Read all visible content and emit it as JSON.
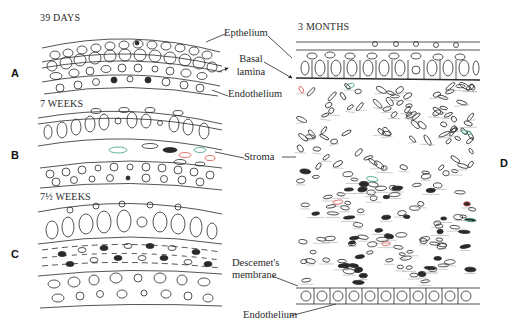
{
  "figure": {
    "topic": "Corneal development stages",
    "panels": [
      {
        "id": "A",
        "stage": "39 DAYS"
      },
      {
        "id": "B",
        "stage": "7 WEEKS"
      },
      {
        "id": "C",
        "stage": "7½ WEEKS"
      },
      {
        "id": "D",
        "stage": "3 MONTHS"
      }
    ],
    "labels": {
      "epithelium": "Epthelium",
      "basal_lamina_1": "Basal",
      "basal_lamina_2": "lamina",
      "endothelium_top": "Endothelium",
      "stroma": "Stroma",
      "descemet_1": "Descemet's",
      "descemet_2": "membrane",
      "endothelium_bottom": "Endothelium"
    },
    "colors": {
      "line": "#2a2a2a",
      "accent_red": "#d9534f",
      "accent_green": "#3aa07a",
      "background": "#ffffff"
    }
  }
}
